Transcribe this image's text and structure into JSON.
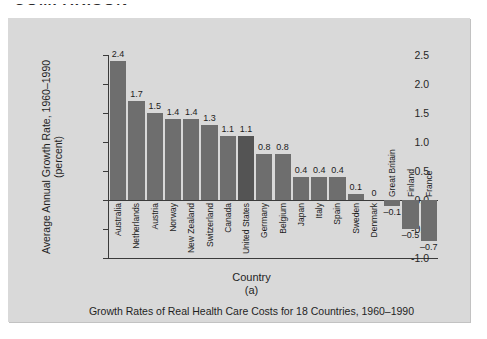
{
  "page": {
    "top_heading_fragment": "COMPARISON"
  },
  "figure": {
    "caption": "Growth Rates of Real Health Care Costs for 18 Countries, 1960–1990",
    "subfigure_label": "(a)",
    "panel_color": "#d9d9d9",
    "bar_color": "#6e6e6e",
    "highlight_bar_color": "#545454",
    "axis_color": "#3a3a3a"
  },
  "chart_data": {
    "type": "bar",
    "title": "Growth Rates of Real Health Care Costs for 18 Countries, 1960–1990",
    "xlabel": "Country",
    "ylabel": "Average Annual Growth Rate, 1960–1990 (percent)",
    "ylabel_line1": "Average Annual Growth Rate, 1960–1990",
    "ylabel_line2": "(percent)",
    "ylim": [
      -1.0,
      2.5
    ],
    "yticks": [
      2.5,
      2.0,
      1.5,
      1.0,
      0.5,
      0.0,
      -0.5,
      -1.0
    ],
    "ytick_labels": [
      "2.5",
      "2.0",
      "1.5",
      "1.0",
      "0.5",
      "0.0",
      "-0.5",
      "-1.0"
    ],
    "grid": false,
    "legend": null,
    "highlight": "United States",
    "categories": [
      "Australia",
      "Netherlands",
      "Austria",
      "Norway",
      "New Zealand",
      "Switzerland",
      "Canada",
      "United States",
      "Germany",
      "Belgium",
      "Japan",
      "Italy",
      "Spain",
      "Sweden",
      "Denmark",
      "Great Britain",
      "Finland",
      "France"
    ],
    "values": [
      2.4,
      1.7,
      1.5,
      1.4,
      1.4,
      1.3,
      1.1,
      1.1,
      0.8,
      0.8,
      0.4,
      0.4,
      0.4,
      0.1,
      0,
      -0.1,
      -0.5,
      -0.7
    ],
    "value_labels": [
      "2.4",
      "1.7",
      "1.5",
      "1.4",
      "1.4",
      "1.3",
      "1.1",
      "1.1",
      "0.8",
      "0.8",
      "0.4",
      "0.4",
      "0.4",
      "0.1",
      "0",
      "–0.1",
      "–0.5",
      "–0.7"
    ]
  }
}
